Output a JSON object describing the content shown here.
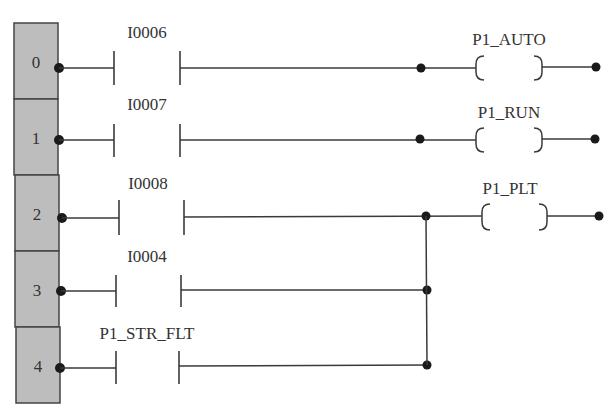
{
  "diagram": {
    "type": "ladder-logic",
    "rungs": [
      {
        "number": "0",
        "contact": "I0006",
        "coil": "P1_AUTO"
      },
      {
        "number": "1",
        "contact": "I0007",
        "coil": "P1_RUN"
      },
      {
        "number": "2",
        "contact": "I0008",
        "coil": "P1_PLT"
      },
      {
        "number": "3",
        "contact": "I0004",
        "coil": ""
      },
      {
        "number": "4",
        "contact": "P1_STR_FLT",
        "coil": ""
      }
    ],
    "branch_note": "Rungs 2, 3, 4 contacts in parallel driving P1_PLT",
    "colors": {
      "rail": "#bdbdbd",
      "line": "#3a3a3a",
      "node": "#1a1a1a"
    }
  }
}
